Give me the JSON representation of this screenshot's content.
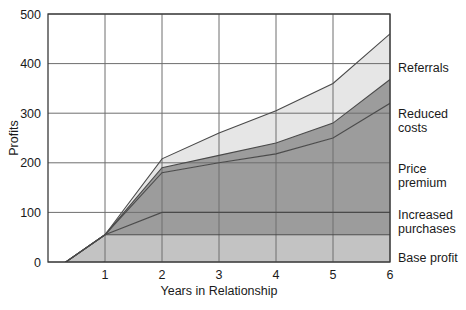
{
  "chart_data": {
    "type": "area",
    "title": "",
    "xlabel": "Years in Relationship",
    "ylabel": "Profits",
    "xlim": [
      0,
      6
    ],
    "ylim": [
      0,
      500
    ],
    "xticks": [
      "1",
      "2",
      "3",
      "4",
      "5",
      "6"
    ],
    "xtick_values": [
      1,
      2,
      3,
      4,
      5,
      6
    ],
    "yticks": [
      "0",
      "100",
      "200",
      "300",
      "400",
      "500"
    ],
    "ytick_values": [
      0,
      100,
      200,
      300,
      400,
      500
    ],
    "grid": true,
    "stacked": true,
    "legend_position": "right-outside",
    "x": [
      0,
      1,
      2,
      3,
      4,
      5,
      6
    ],
    "series": [
      {
        "name": "Base profit",
        "label": "Base profit",
        "color": "#c3c3c3",
        "values": [
          -25,
          55,
          55,
          55,
          55,
          55,
          55
        ]
      },
      {
        "name": "Increased purchases",
        "label": "Increased purchases",
        "color": "#9c9c9c",
        "values": [
          0,
          0,
          45,
          45,
          45,
          45,
          45
        ]
      },
      {
        "name": "Price premium",
        "label": "Price premium",
        "color": "#9c9c9c",
        "values": [
          0,
          0,
          80,
          100,
          118,
          150,
          220
        ]
      },
      {
        "name": "Reduced costs",
        "label": "Reduced costs",
        "color": "#9c9c9c",
        "values": [
          0,
          0,
          10,
          15,
          22,
          30,
          48
        ]
      },
      {
        "name": "Referrals",
        "label": "Referrals",
        "color": "#e6e6e6",
        "values": [
          0,
          0,
          18,
          45,
          65,
          80,
          92
        ]
      }
    ],
    "cumulative_tops": {
      "base_profit": [
        -25,
        55,
        55,
        55,
        55,
        55,
        55
      ],
      "increased_purchases": [
        -25,
        55,
        100,
        100,
        100,
        100,
        100
      ],
      "price_premium": [
        -25,
        55,
        180,
        200,
        218,
        250,
        320
      ],
      "reduced_costs": [
        -25,
        55,
        190,
        215,
        240,
        280,
        368
      ],
      "referrals": [
        -25,
        55,
        208,
        260,
        305,
        360,
        460
      ]
    }
  },
  "legend": {
    "items": [
      {
        "label": "Referrals"
      },
      {
        "label": "Reduced",
        "label2": "costs"
      },
      {
        "label": "Price",
        "label2": "premium"
      },
      {
        "label": "Increased",
        "label2": "purchases"
      },
      {
        "label": "Base profit"
      }
    ]
  },
  "colors": {
    "band_light": "#e6e6e6",
    "band_dark": "#9c9c9c",
    "band_base": "#c3c3c3",
    "axis": "#3a3a3a",
    "grid": "#6e6e6e",
    "text": "#1a1a1a"
  }
}
